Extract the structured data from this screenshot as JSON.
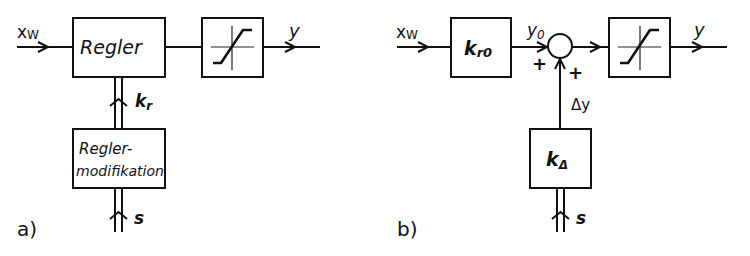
{
  "diagram_a": {
    "caption": "a)",
    "input_label": "x",
    "input_sub": "W",
    "output_label": "y",
    "controller_block": "Regler",
    "modifier_block_line1": "Regler-",
    "modifier_block_line2": "modifikation",
    "param_label": "k",
    "param_sub": "r",
    "schedule_label": "s",
    "saturation_block": "saturation"
  },
  "diagram_b": {
    "caption": "b)",
    "input_label": "x",
    "input_sub": "W",
    "gain_block": "k",
    "gain_sub": "r0",
    "nominal_output_label": "y",
    "nominal_output_sub": "0",
    "sum_sign_left": "+",
    "sum_sign_bottom": "+",
    "delta_label": "Δy",
    "delta_block": "k",
    "delta_block_sub": "Δ",
    "schedule_label": "s",
    "output_label": "y",
    "saturation_block": "saturation"
  }
}
